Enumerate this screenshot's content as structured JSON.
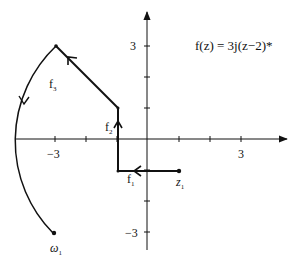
{
  "diagram": {
    "equation": "f(z) = 3j(z−2)*",
    "axes": {
      "x_ticks": [
        -3,
        -2,
        -1,
        1,
        2,
        3
      ],
      "y_ticks": [
        -3,
        -2,
        -1,
        1,
        2,
        3
      ],
      "x_labels": {
        "neg3": "−3",
        "pos3": "3"
      },
      "y_labels": {
        "pos3": "3",
        "neg3": "−3"
      }
    },
    "points": {
      "z1": {
        "label_main": "z",
        "label_sub": "1",
        "x": 1,
        "y": -1
      },
      "w1": {
        "label_main": "ω",
        "label_sub": "1",
        "x": -3,
        "y": -3
      }
    },
    "steps": {
      "f1": {
        "label_main": "f",
        "label_sub": "1",
        "from": [
          1,
          -1
        ],
        "to": [
          -1,
          -1
        ]
      },
      "f2": {
        "label_main": "f",
        "label_sub": "2",
        "from": [
          -1,
          -1
        ],
        "to": [
          -1,
          1
        ]
      },
      "f3": {
        "label_main": "f",
        "label_sub": "3",
        "from": [
          -1,
          1
        ],
        "to": [
          -3,
          3
        ],
        "then_arc_to": [
          -3,
          -3
        ]
      }
    },
    "colors": {
      "ink": "#111111",
      "background": "#ffffff"
    }
  }
}
